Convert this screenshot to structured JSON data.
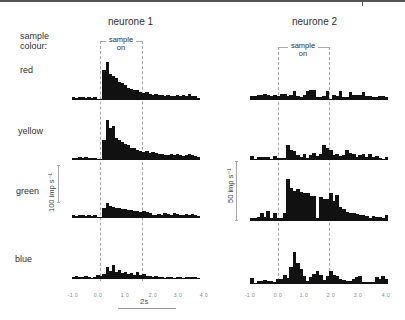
{
  "figure": {
    "neurone1_title": "neurone 1",
    "neurone2_title": "neurone 2",
    "sample_colour_label_line1": "sample",
    "sample_colour_label_line2": "colour:",
    "sample_on_line1": "sample",
    "sample_on_line2": "on",
    "rows": [
      "red",
      "yellow",
      "green",
      "blue"
    ],
    "scale_n1": "100 imp s⁻¹",
    "scale_n2": "50 imp s⁻¹",
    "time_scale": "2s",
    "x_ticks": [
      "-1.0",
      "0.0",
      "1.0",
      "2.0",
      "3.0",
      "4.0"
    ]
  },
  "chart_data": {
    "type": "bar",
    "xlabel": "time (s)",
    "xlim": [
      -1.0,
      4.0
    ],
    "x_ticks": [
      -1.0,
      0.0,
      1.0,
      2.0,
      3.0,
      4.0
    ],
    "stimulus": {
      "label": "sample on",
      "onset_s": 0.0,
      "offset_s": 1.5
    },
    "bin_width_s": 0.12,
    "units": "relative bar height (px); n1 scale 100 imp/s, n2 scale 50 imp/s",
    "panels": [
      {
        "neurone": "neurone 1",
        "colour": "red",
        "values": [
          3,
          2,
          3,
          3,
          2,
          3,
          2,
          3,
          1,
          1,
          30,
          38,
          26,
          24,
          22,
          18,
          17,
          15,
          12,
          11,
          10,
          10,
          8,
          7,
          8,
          6,
          5,
          6,
          5,
          5,
          4,
          5,
          4,
          4,
          5,
          4,
          5,
          4,
          6,
          4,
          4,
          2
        ]
      },
      {
        "neurone": "neurone 1",
        "colour": "yellow",
        "values": [
          2,
          2,
          3,
          2,
          3,
          2,
          2,
          2,
          1,
          1,
          20,
          40,
          32,
          34,
          22,
          20,
          18,
          16,
          15,
          12,
          12,
          10,
          9,
          8,
          9,
          7,
          8,
          7,
          6,
          6,
          5,
          5,
          6,
          5,
          6,
          5,
          4,
          5,
          6,
          5,
          4,
          3
        ]
      },
      {
        "neurone": "neurone 1",
        "colour": "green",
        "values": [
          3,
          2,
          3,
          3,
          2,
          3,
          2,
          3,
          1,
          1,
          10,
          15,
          12,
          11,
          10,
          10,
          9,
          9,
          8,
          8,
          7,
          7,
          6,
          7,
          6,
          5,
          3,
          3,
          4,
          3,
          5,
          4,
          3,
          5,
          4,
          3,
          3,
          4,
          3,
          4,
          3,
          2
        ]
      },
      {
        "neurone": "neurone 1",
        "colour": "blue",
        "values": [
          2,
          3,
          2,
          2,
          3,
          2,
          1,
          2,
          4,
          3,
          5,
          12,
          8,
          14,
          7,
          9,
          6,
          7,
          5,
          6,
          4,
          7,
          4,
          5,
          3,
          3,
          2,
          3,
          2,
          2,
          1,
          2,
          2,
          1,
          2,
          2,
          1,
          2,
          2,
          2,
          2,
          1
        ]
      },
      {
        "neurone": "neurone 2",
        "colour": "red",
        "values": [
          4,
          4,
          5,
          5,
          6,
          5,
          4,
          5,
          4,
          6,
          6,
          4,
          5,
          9,
          4,
          3,
          5,
          9,
          10,
          10,
          3,
          3,
          4,
          9,
          1,
          5,
          4,
          9,
          3,
          3,
          8,
          5,
          5,
          5,
          8,
          4,
          4,
          3,
          3,
          4,
          4,
          3
        ]
      },
      {
        "neurone": "neurone 2",
        "colour": "yellow",
        "values": [
          4,
          0,
          3,
          3,
          3,
          3,
          0,
          4,
          2,
          2,
          2,
          15,
          10,
          9,
          5,
          3,
          6,
          2,
          5,
          7,
          4,
          6,
          15,
          12,
          10,
          5,
          6,
          4,
          5,
          10,
          7,
          6,
          3,
          5,
          6,
          3,
          6,
          3,
          4,
          2,
          1,
          3
        ]
      },
      {
        "neurone": "neurone 2",
        "colour": "green",
        "values": [
          3,
          3,
          4,
          8,
          4,
          10,
          3,
          8,
          3,
          3,
          8,
          42,
          33,
          30,
          32,
          29,
          28,
          28,
          25,
          25,
          3,
          24,
          22,
          22,
          28,
          20,
          26,
          14,
          12,
          9,
          8,
          8,
          7,
          6,
          6,
          5,
          3,
          5,
          4,
          4,
          3,
          6
        ]
      },
      {
        "neurone": "neurone 2",
        "colour": "blue",
        "values": [
          6,
          0,
          3,
          3,
          4,
          3,
          3,
          2,
          5,
          5,
          9,
          6,
          17,
          32,
          21,
          15,
          8,
          3,
          7,
          10,
          13,
          9,
          4,
          8,
          13,
          9,
          8,
          5,
          4,
          3,
          3,
          5,
          7,
          8,
          2,
          2,
          2,
          2,
          7,
          5,
          8,
          5
        ]
      }
    ]
  }
}
